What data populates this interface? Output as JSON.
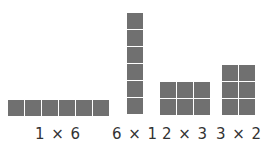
{
  "arrays": [
    {
      "rows": 1,
      "cols": 6,
      "label": "1 × 6"
    },
    {
      "rows": 6,
      "cols": 1,
      "label": "6 × 1"
    },
    {
      "rows": 2,
      "cols": 3,
      "label": "2 × 3"
    },
    {
      "rows": 3,
      "cols": 2,
      "label": "3 × 2"
    }
  ],
  "colors": {
    "square": "#707070",
    "label": "#333333"
  }
}
